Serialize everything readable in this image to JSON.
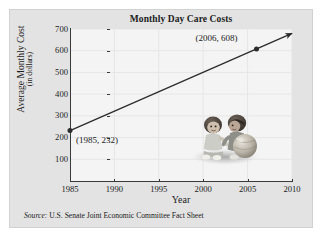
{
  "figure": {
    "title": "Monthly Day Care Costs",
    "source_keyword": "Source:",
    "source_text": " U.S. Senate Joint Economic Committee Fact Sheet",
    "photo_name": "two-children-with-ball-photo"
  },
  "chart_data": {
    "type": "line",
    "title": "Monthly Day Care Costs",
    "xlabel": "Year",
    "ylabel": "Average Monthly Cost",
    "ylabel_sub": "(in dollars)",
    "x": [
      1985,
      2006
    ],
    "values": [
      232,
      608
    ],
    "series": [
      {
        "name": "Average Monthly Cost",
        "x": [
          1985,
          2006
        ],
        "values": [
          232,
          608
        ]
      }
    ],
    "points": [
      {
        "label": "(1985, 232)",
        "x": 1985,
        "y": 232
      },
      {
        "label": "(2006, 608)",
        "x": 2006,
        "y": 608
      }
    ],
    "xlim": [
      1985,
      2010
    ],
    "ylim": [
      0,
      700
    ],
    "xticks": [
      1985,
      1990,
      1995,
      2000,
      2005,
      2010
    ],
    "xtick_labels": [
      "1985",
      "1990",
      "1995",
      "2000",
      "2005",
      "2010"
    ],
    "yticks": [
      100,
      200,
      300,
      400,
      500,
      600,
      700
    ],
    "ytick_labels": [
      "100",
      "200",
      "300",
      "400",
      "500",
      "600",
      "700"
    ],
    "grid": true,
    "grid_axis": "both",
    "legend": false,
    "line_extends_with_arrow": true,
    "arrow_end_year": 2010,
    "line_color": "#2b2b2b",
    "plot_background": "#f4f4f4",
    "panel_background": "#e3e3e3"
  },
  "colors": {
    "line": "#2b2b2b",
    "axis": "#3a3a3a",
    "grid": "#e6e6e6",
    "text": "#1b1b1b",
    "panel": "#e3e3e3",
    "plot": "#f4f4f4"
  }
}
